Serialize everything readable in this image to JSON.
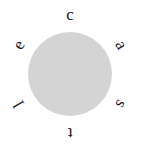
{
  "image": {
    "width": 141,
    "height": 146,
    "background_color": "#ffffff"
  },
  "disc": {
    "center_x": 70,
    "center_y": 74,
    "diameter": 84,
    "fill_color": "#cccccc"
  },
  "word": {
    "text": "castle",
    "reading_direction": "clockwise from top",
    "letter_color": "#1a1a1a",
    "ring_radius": 59
  },
  "letters": [
    {
      "char": "c",
      "angle_deg": 0,
      "rotation_deg": 0,
      "position": "top"
    },
    {
      "char": "a",
      "angle_deg": 60,
      "rotation_deg": 60,
      "position": "upper-right"
    },
    {
      "char": "s",
      "angle_deg": 120,
      "rotation_deg": 120,
      "position": "lower-right"
    },
    {
      "char": "t",
      "angle_deg": 180,
      "rotation_deg": 180,
      "position": "bottom"
    },
    {
      "char": "l",
      "angle_deg": 240,
      "rotation_deg": 240,
      "position": "lower-left"
    },
    {
      "char": "e",
      "angle_deg": 300,
      "rotation_deg": 300,
      "position": "upper-left"
    }
  ]
}
